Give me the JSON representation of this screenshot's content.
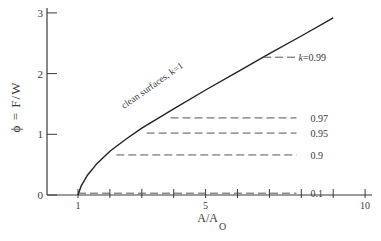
{
  "chart_data": {
    "type": "line",
    "title": "",
    "xlabel": "A/A",
    "xlabel_sub": "O",
    "ylabel": "ϕ  =  F/W",
    "xlim": [
      1,
      10
    ],
    "ylim": [
      0,
      3
    ],
    "x_ticks": [
      1,
      2,
      3,
      4,
      5,
      6,
      7,
      8,
      9,
      10
    ],
    "x_tick_labels": [
      {
        "value": 1,
        "label": "1"
      },
      {
        "value": 5,
        "label": "5"
      },
      {
        "value": 10,
        "label": "10"
      }
    ],
    "y_ticks": [
      0,
      1,
      2,
      3
    ],
    "y_tick_labels": [
      "0",
      "1",
      "2",
      "3"
    ],
    "grid": false,
    "series": [
      {
        "name": "clean surfaces, k=1",
        "label": "clean surfaces, k=1",
        "style": "solid",
        "x": [
          1.0,
          1.1,
          1.3,
          1.6,
          2.0,
          2.5,
          3.0,
          4.0,
          5.0,
          6.0,
          7.0,
          8.0,
          9.0
        ],
        "y": [
          0.0,
          0.15,
          0.33,
          0.52,
          0.72,
          0.92,
          1.1,
          1.42,
          1.73,
          2.03,
          2.33,
          2.62,
          2.92
        ]
      },
      {
        "name": "k=0.99",
        "label": "k=0.99",
        "style": "dashed",
        "x": [
          6.8,
          7.85
        ],
        "y": [
          2.27,
          2.27
        ]
      },
      {
        "name": "k=0.97",
        "label": "0.97",
        "style": "dashed",
        "x": [
          3.9,
          7.85
        ],
        "y": [
          1.27,
          1.27
        ]
      },
      {
        "name": "k=0.95",
        "label": "0.95",
        "style": "dashed",
        "x": [
          3.15,
          7.85
        ],
        "y": [
          1.02,
          1.02
        ]
      },
      {
        "name": "k=0.9",
        "label": "0.9",
        "style": "dashed",
        "x": [
          2.2,
          7.85
        ],
        "y": [
          0.66,
          0.66
        ]
      },
      {
        "name": "k=0.1",
        "label": "0.1",
        "style": "dashed",
        "x": [
          1.0,
          7.85
        ],
        "y": [
          0.03,
          0.03
        ]
      }
    ],
    "annotations": [
      {
        "text": "clean surfaces, k=1",
        "along": "solid curve"
      },
      {
        "text": "k=0.99"
      },
      {
        "text": "0.97"
      },
      {
        "text": "0.95"
      },
      {
        "text": "0.9"
      },
      {
        "text": "0.1"
      }
    ],
    "legend": "none (inline labels)"
  }
}
